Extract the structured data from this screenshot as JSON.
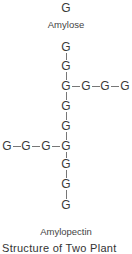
{
  "amylose": {
    "unit": "G",
    "label": "Amylose"
  },
  "amylopectin": {
    "unit": "G",
    "label": "Amylopectin",
    "main_chain_count": 9,
    "right_branch_at_index": 2,
    "right_branch_length": 3,
    "left_branch_at_index": 5,
    "left_branch_length": 3
  },
  "caption": "Structure of Two Plant"
}
